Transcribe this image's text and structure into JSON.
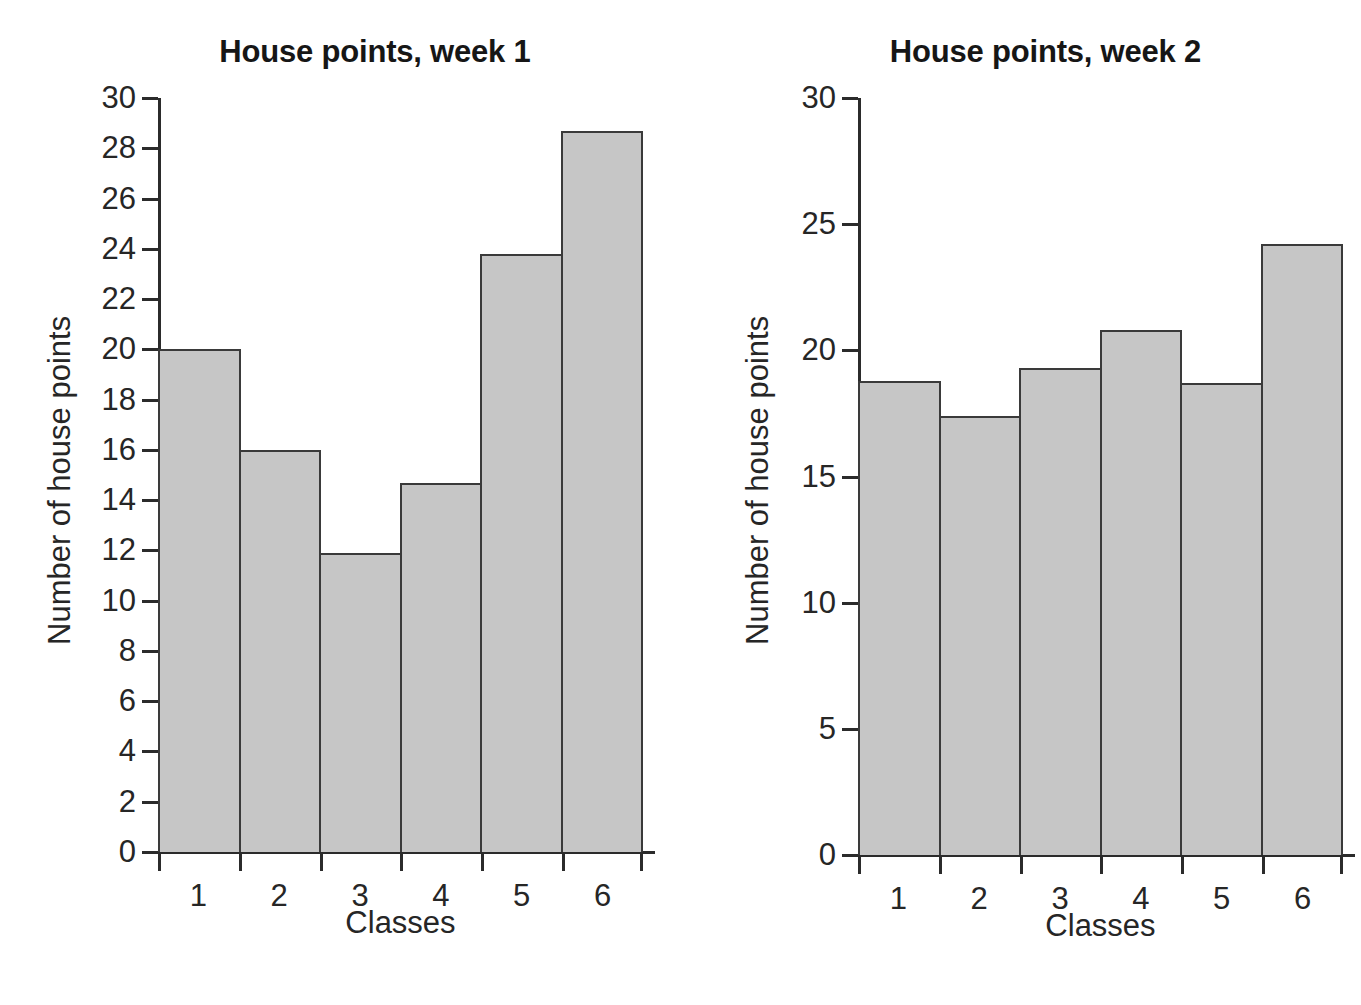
{
  "chart_data": [
    {
      "type": "bar",
      "title": "House points, week 1",
      "xlabel": "Classes",
      "ylabel": "Number of house points",
      "categories": [
        "1",
        "2",
        "3",
        "4",
        "5",
        "6"
      ],
      "values": [
        20.0,
        16.0,
        11.9,
        14.7,
        23.8,
        28.7
      ],
      "ylim": [
        0,
        30
      ],
      "ytick_step": 2,
      "yticks": [
        0,
        2,
        4,
        6,
        8,
        10,
        12,
        14,
        16,
        18,
        20,
        22,
        24,
        26,
        28,
        30
      ],
      "ytick_labels": [
        "0",
        "2",
        "4",
        "6",
        "8",
        "10",
        "12",
        "14",
        "16",
        "18",
        "20",
        "22",
        "24",
        "26",
        "28",
        "30"
      ],
      "grid": false,
      "legend": "none",
      "bar_fill": "#c6c6c6",
      "bar_edge": "#3a3a3a",
      "axis_color": "#2b2b2b",
      "background": "#ffffff"
    },
    {
      "type": "bar",
      "title": "House points, week 2",
      "xlabel": "Classes",
      "ylabel": "Number of house points",
      "categories": [
        "1",
        "2",
        "3",
        "4",
        "5",
        "6"
      ],
      "values": [
        18.8,
        17.4,
        19.3,
        20.8,
        18.7,
        24.2
      ],
      "ylim": [
        0,
        30
      ],
      "ytick_step": 5,
      "yticks": [
        0,
        5,
        10,
        15,
        20,
        25,
        30
      ],
      "ytick_labels": [
        "0",
        "5",
        "10",
        "15",
        "20",
        "25",
        "30"
      ],
      "grid": false,
      "legend": "none",
      "bar_fill": "#c6c6c6",
      "bar_edge": "#3a3a3a",
      "axis_color": "#2b2b2b",
      "background": "#ffffff"
    }
  ]
}
